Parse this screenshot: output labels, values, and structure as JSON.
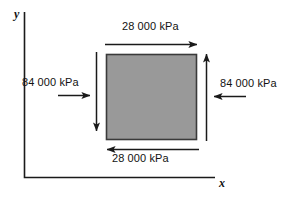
{
  "figure": {
    "background_color": "#ffffff",
    "line_color": "#1a1a1a",
    "element_fill_color": "#999999",
    "element_border_color": "#333333",
    "axes": {
      "y_label": "y",
      "x_label": "x",
      "origin_px": [
        24,
        177
      ],
      "y_axis_top_px": 12,
      "x_axis_right_px": 215
    },
    "element": {
      "shape": "square",
      "left_px": 106,
      "top_px": 54,
      "width_px": 91,
      "height_px": 86
    },
    "loads": [
      {
        "name": "top-shear",
        "label": "28 000 kPa",
        "value": 28000,
        "unit": "kPa",
        "direction": "right",
        "edge": "top"
      },
      {
        "name": "bottom-shear",
        "label": "28 000 kPa",
        "value": 28000,
        "unit": "kPa",
        "direction": "left",
        "edge": "bottom"
      },
      {
        "name": "left-shear-vertical",
        "label": "",
        "value": 84000,
        "unit": "kPa",
        "direction": "down",
        "edge": "left"
      },
      {
        "name": "right-shear-vertical",
        "label": "",
        "value": 84000,
        "unit": "kPa",
        "direction": "up",
        "edge": "right"
      },
      {
        "name": "left-normal",
        "label": "84 000 kPa",
        "value": 84000,
        "unit": "kPa",
        "direction": "right",
        "edge": "left"
      },
      {
        "name": "right-normal",
        "label": "84 000 kPa",
        "value": 84000,
        "unit": "kPa",
        "direction": "left",
        "edge": "right"
      }
    ]
  }
}
